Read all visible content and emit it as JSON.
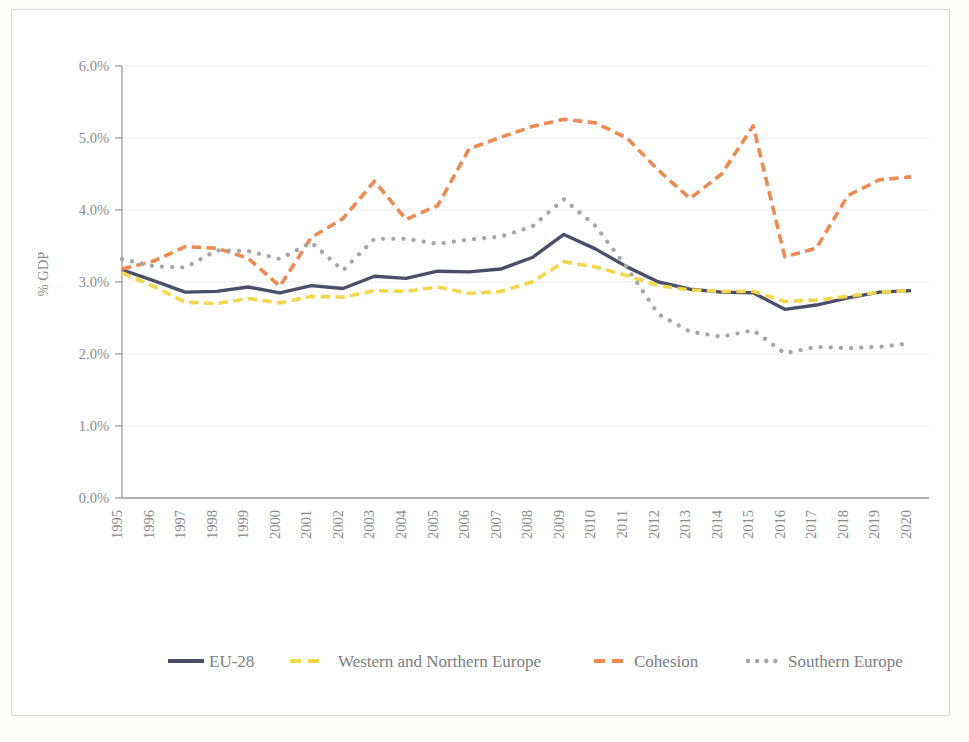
{
  "chart_data": {
    "type": "line",
    "title": "",
    "xlabel": "",
    "ylabel": "% GDP",
    "ylim": [
      0,
      6
    ],
    "ytick_labels": [
      "0.0%",
      "1.0%",
      "2.0%",
      "3.0%",
      "4.0%",
      "5.0%",
      "6.0%"
    ],
    "ytick_values": [
      0,
      1,
      2,
      3,
      4,
      5,
      6
    ],
    "grid": true,
    "legend_position": "bottom",
    "x": [
      1995,
      1996,
      1997,
      1998,
      1999,
      2000,
      2001,
      2002,
      2003,
      2004,
      2005,
      2006,
      2007,
      2008,
      2009,
      2010,
      2011,
      2012,
      2013,
      2014,
      2015,
      2016,
      2017,
      2018,
      2019,
      2020
    ],
    "categories": [
      "1995",
      "1996",
      "1997",
      "1998",
      "1999",
      "2000",
      "2001",
      "2002",
      "2003",
      "2004",
      "2005",
      "2006",
      "2007",
      "2008",
      "2009",
      "2010",
      "2011",
      "2012",
      "2013",
      "2014",
      "2015",
      "2016",
      "2017",
      "2018",
      "2019",
      "2020"
    ],
    "series": [
      {
        "name": "EU-28",
        "color": "#4a4e69",
        "style": "solid",
        "values": [
          3.17,
          3.02,
          2.86,
          2.87,
          2.93,
          2.85,
          2.95,
          2.91,
          3.08,
          3.05,
          3.15,
          3.14,
          3.18,
          3.34,
          3.66,
          3.46,
          3.21,
          3.0,
          2.9,
          2.86,
          2.85,
          2.62,
          2.68,
          2.78,
          2.86,
          2.88
        ]
      },
      {
        "name": "Western and Northern Europe",
        "color": "#f2d64b",
        "style": "dashed",
        "values": [
          3.13,
          2.94,
          2.72,
          2.7,
          2.77,
          2.71,
          2.8,
          2.79,
          2.88,
          2.87,
          2.93,
          2.84,
          2.87,
          3.0,
          3.28,
          3.21,
          3.09,
          2.95,
          2.89,
          2.87,
          2.87,
          2.73,
          2.75,
          2.8,
          2.86,
          2.88
        ]
      },
      {
        "name": "Cohesion",
        "color": "#ec8a52",
        "style": "dashed",
        "values": [
          3.18,
          3.29,
          3.49,
          3.47,
          3.33,
          2.94,
          3.62,
          3.88,
          4.4,
          3.87,
          4.06,
          4.85,
          5.01,
          5.16,
          5.26,
          5.21,
          5.0,
          4.55,
          4.16,
          4.5,
          5.17,
          3.35,
          3.47,
          4.2,
          4.42,
          4.46
        ]
      },
      {
        "name": "Southern Europe",
        "color": "#a6a6a6",
        "style": "dotted",
        "values": [
          3.32,
          3.22,
          3.2,
          3.44,
          3.43,
          3.32,
          3.55,
          3.16,
          3.6,
          3.6,
          3.53,
          3.59,
          3.63,
          3.77,
          4.15,
          3.78,
          3.2,
          2.55,
          2.31,
          2.24,
          2.33,
          2.01,
          2.1,
          2.08,
          2.1,
          2.15
        ]
      }
    ]
  },
  "legend": {
    "items": [
      {
        "label": "EU-28",
        "color": "#4a4e69",
        "style": "solid"
      },
      {
        "label": "Western and Northern Europe",
        "color": "#f2d64b",
        "style": "dashed"
      },
      {
        "label": "Cohesion",
        "color": "#ec8a52",
        "style": "dashed"
      },
      {
        "label": "Southern Europe",
        "color": "#a6a6a6",
        "style": "dotted"
      }
    ]
  },
  "axes": {
    "y_title": "% GDP"
  }
}
